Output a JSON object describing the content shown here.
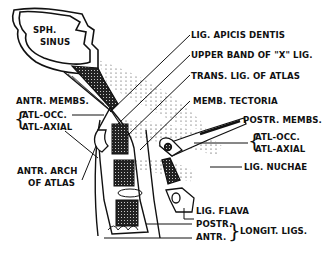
{
  "figure": {
    "ink_color": "#111111",
    "background": "#ffffff"
  },
  "labels": {
    "sph_sinus_line1": "SPH.",
    "sph_sinus_line2": "SINUS",
    "lig_apicis_dentis": "LIG. APICIS DENTIS",
    "upper_band": "UPPER BAND OF \"X\" LIG.",
    "trans_lig": "TRANS. LIG. OF ATLAS",
    "memb_tectoria": "MEMB. TECTORIA",
    "antr_membs": "ANTR. MEMBS.",
    "antr_atl_occ": "ATL-OCC.",
    "antr_atl_axial": "ATL-AXIAL",
    "antr_arch_line1": "ANTR. ARCH",
    "antr_arch_line2": "OF ATLAS",
    "postr_membs": "POSTR. MEMBS.",
    "postr_atl_occ": "ATL-OCC.",
    "postr_atl_axial": "ATL-AXIAL",
    "lig_nuchae": "LIG. NUCHAE",
    "lig_flava": "LIG. FLAVA",
    "postr": "POSTR.",
    "antr": "ANTR.",
    "longit_ligs": "LONGIT. LIGS."
  }
}
